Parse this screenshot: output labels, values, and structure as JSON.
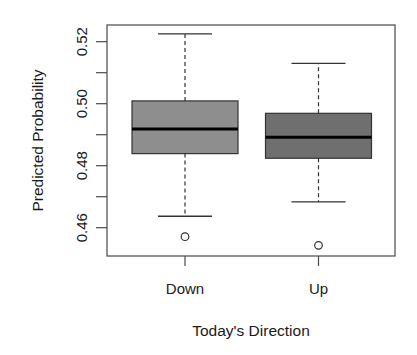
{
  "chart_data": {
    "type": "boxplot",
    "title": "",
    "xlabel": "Today's Direction",
    "ylabel": "Predicted Probability",
    "ylim": [
      0.4515,
      0.5255
    ],
    "yticks": [
      0.46,
      0.47,
      0.48,
      0.49,
      0.5,
      0.51,
      0.52
    ],
    "ytick_labels": [
      "0.46",
      "",
      "0.48",
      "",
      "0.50",
      "",
      "0.52"
    ],
    "categories": [
      "Down",
      "Up"
    ],
    "grid": false,
    "legend": null,
    "boxes": [
      {
        "name": "Down",
        "whisker_low": 0.4637,
        "q1": 0.4839,
        "median": 0.4918,
        "q3": 0.5009,
        "whisker_high": 0.5225,
        "outliers": [
          0.4571
        ],
        "color": "#8e8e8e"
      },
      {
        "name": "Up",
        "whisker_low": 0.4683,
        "q1": 0.4824,
        "median": 0.4892,
        "q3": 0.4969,
        "whisker_high": 0.513,
        "outliers": [
          0.4543
        ],
        "color": "#6f6f6f"
      }
    ]
  },
  "colors": {
    "axis": "#4a4a4a",
    "text": "#1a1a1a",
    "median": "#000000"
  }
}
